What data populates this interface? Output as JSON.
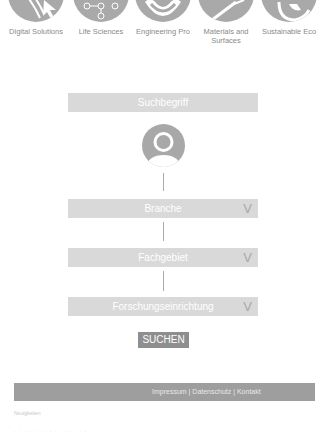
{
  "categories": [
    {
      "label": "Digital Solutions",
      "icon": "cursor-icon"
    },
    {
      "label": "Life Sciences",
      "icon": "molecule-icon"
    },
    {
      "label": "Engineering Pro",
      "icon": "smile-icon"
    },
    {
      "label": "Materials and Surfaces",
      "icon": "wand-icon"
    },
    {
      "label": "Sustainable Eco",
      "icon": "leaf-icon"
    }
  ],
  "search": {
    "term_label": "Suchbegriff",
    "branch_label": "Branche",
    "field_label": "Fachgebiet",
    "institution_label": "Forschungseinrichtung",
    "chevron": "V",
    "submit_label": "SUCHEN"
  },
  "footer": {
    "links": "Impressum | Datenschutz | Kontakt"
  },
  "faint": {
    "line1": "Neuigkeiten",
    "line2": "· · · · · · · · · · · · · · ·"
  },
  "colors": {
    "icon_gray": "#a9a9a9",
    "bar_gray": "#d9d9d9",
    "button_gray": "#8e8e8e",
    "footer_gray": "#9e9e9e"
  }
}
